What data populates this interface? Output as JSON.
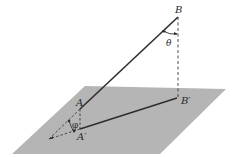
{
  "diagram": {
    "labels": {
      "B": "B",
      "B_prime": "B′",
      "A": "A",
      "A_prime": "A′",
      "theta": "θ",
      "phi": "φ"
    },
    "colors": {
      "plane": "#b5b5b5",
      "line": "#2e2e2e",
      "dashed": "#3a3a3a",
      "background": "#ffffff"
    },
    "points": {
      "B": [
        178,
        17
      ],
      "B_prime": [
        177,
        98
      ],
      "A": [
        80,
        109
      ],
      "A_prime": [
        80,
        129
      ],
      "vanish": [
        49,
        139
      ]
    }
  }
}
